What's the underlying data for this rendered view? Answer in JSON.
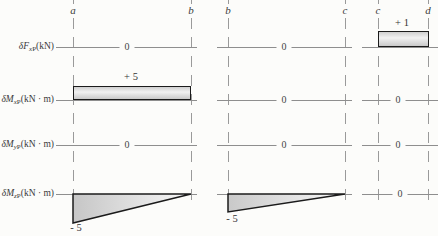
{
  "figure": {
    "background": "#fcfcfa",
    "line_color": "#8e8e8e",
    "outline_color": "#1b1b1b",
    "fill_dark": "#c6c6c6",
    "fill_light": "#f8f8f8"
  },
  "nodes": [
    {
      "label": "a"
    },
    {
      "label": "b"
    },
    {
      "label": "b"
    },
    {
      "label": "c"
    },
    {
      "label": "c"
    },
    {
      "label": "d"
    }
  ],
  "rows": [
    {
      "symbol": "δF",
      "sub_var": "x",
      "sub_suffix": "P",
      "unit": "(kN)"
    },
    {
      "symbol": "δM",
      "sub_var": "x",
      "sub_suffix": "P",
      "unit": "(kN · m)"
    },
    {
      "symbol": "δM",
      "sub_var": "y",
      "sub_suffix": "P",
      "unit": "(kN · m)"
    },
    {
      "symbol": "δM",
      "sub_var": "z",
      "sub_suffix": "P",
      "unit": "(kN · m)"
    }
  ],
  "panels": [
    {
      "from": "a",
      "to": "b",
      "cells": [
        {
          "row": "δF_xP",
          "shape": "zero-line",
          "value": "0"
        },
        {
          "row": "δM_xP",
          "shape": "rect-above",
          "value": "+ 5"
        },
        {
          "row": "δM_yP",
          "shape": "zero-line",
          "value": "0"
        },
        {
          "row": "δM_zP",
          "shape": "triangle-below-max-at-left",
          "value": "- 5"
        }
      ]
    },
    {
      "from": "b",
      "to": "c",
      "cells": [
        {
          "row": "δF_xP",
          "shape": "zero-line",
          "value": "0"
        },
        {
          "row": "δM_xP",
          "shape": "zero-line",
          "value": "0"
        },
        {
          "row": "δM_yP",
          "shape": "zero-line",
          "value": "0"
        },
        {
          "row": "δM_zP",
          "shape": "triangle-below-max-at-left",
          "value": "- 5"
        }
      ]
    },
    {
      "from": "c",
      "to": "d",
      "cells": [
        {
          "row": "δF_xP",
          "shape": "rect-above",
          "value": "+ 1"
        },
        {
          "row": "δM_xP",
          "shape": "zero-line",
          "value": "0"
        },
        {
          "row": "δM_yP",
          "shape": "zero-line",
          "value": "0"
        },
        {
          "row": "δM_zP",
          "shape": "zero-line",
          "value": "0"
        }
      ]
    }
  ]
}
